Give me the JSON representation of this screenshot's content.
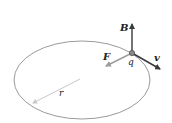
{
  "diagram": {
    "labels": {
      "B": "B",
      "F": "F",
      "q": "q",
      "v": "v",
      "r": "r"
    },
    "colors": {
      "orbit": "#9a9a9a",
      "vector_dark": "#3a3a3a",
      "vector_light": "#9c9c9c",
      "radius": "#c8c8c8",
      "charge": "#6a6a6a"
    }
  }
}
